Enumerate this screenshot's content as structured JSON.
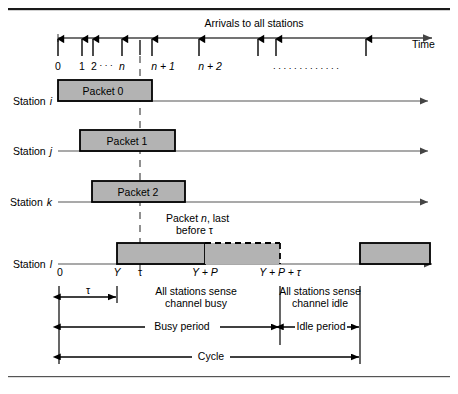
{
  "figure": {
    "title_top_rule": "horizontal-rule",
    "arrivals_label": "Arrivals to all stations",
    "time_axis_label": "Time",
    "arrival_tick_labels": [
      "0",
      "1",
      "2",
      "n",
      "n + 1",
      "n + 2"
    ],
    "ellipsis_small": ". . .",
    "ellipsis_long": ". . . . . . . . . . . . .",
    "stations": [
      {
        "label_prefix": "Station",
        "label_var": "i",
        "packet": "Packet 0"
      },
      {
        "label_prefix": "Station",
        "label_var": "j",
        "packet": "Packet 1"
      },
      {
        "label_prefix": "Station",
        "label_var": "k",
        "packet": "Packet 2"
      },
      {
        "label_prefix": "Station",
        "label_var": "l",
        "packet": ""
      }
    ],
    "annotation": {
      "line1": "Packet n, last",
      "line2": "before τ"
    },
    "timeline_ticks": [
      "0",
      "Y",
      "τ",
      "Y + P",
      "Y + P + τ"
    ],
    "measures": {
      "tau": "τ",
      "busy_sense_line1": "All stations sense",
      "busy_sense_line2": "channel busy",
      "idle_sense_line1": "All stations sense",
      "idle_sense_line2": "channel idle",
      "busy_period": "Busy period",
      "idle_period": "Idle period",
      "cycle": "Cycle"
    },
    "colors": {
      "packet_fill": "#b3b3b3",
      "stroke": "#000000",
      "axis": "#555555",
      "background": "#ffffff"
    }
  }
}
